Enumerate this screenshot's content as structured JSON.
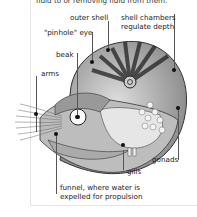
{
  "caption": "fluid to or removing fluid from them.",
  "labels": {
    "outer_shell": "outer shell",
    "shell_chambers": "shell chambers",
    "regulate_depth": "regulate depth",
    "pinhole_eye": "\"pinhole\" eye",
    "beak": "beak",
    "arms": "arms",
    "gonads": "gonads",
    "gills": "gills",
    "funnel_line1": "funnel, where water is",
    "funnel_line2": "expelled for propulsion"
  }
}
